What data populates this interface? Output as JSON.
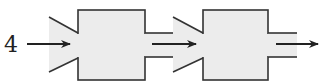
{
  "diagram": {
    "input_label": "4",
    "stages": [
      {
        "id": "stage-1"
      },
      {
        "id": "stage-2"
      }
    ],
    "colors": {
      "stroke": "#333333",
      "fill": "#ececec",
      "background": "#ffffff"
    }
  }
}
